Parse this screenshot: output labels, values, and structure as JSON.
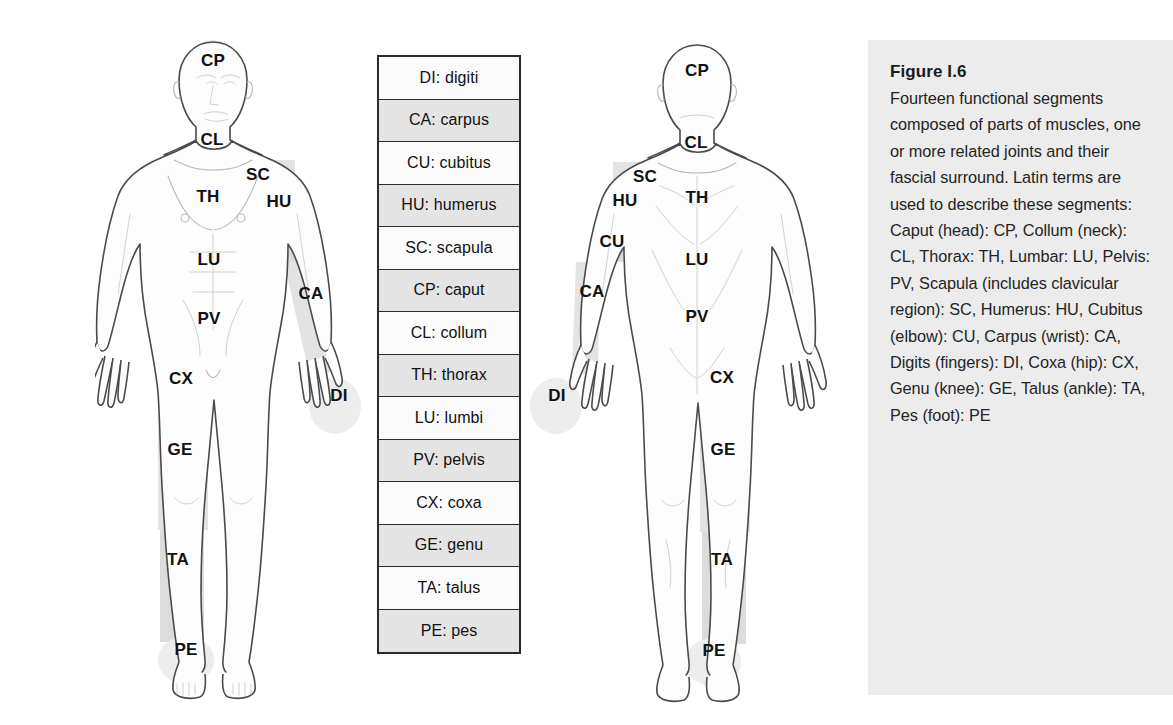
{
  "legend": {
    "name": "segment-abbreviation-key",
    "rows": [
      {
        "code": "DI",
        "term": "digiti",
        "text": "DI: digiti"
      },
      {
        "code": "CA",
        "term": "carpus",
        "text": "CA: carpus"
      },
      {
        "code": "CU",
        "term": "cubitus",
        "text": "CU: cubitus"
      },
      {
        "code": "HU",
        "term": "humerus",
        "text": "HU: humerus"
      },
      {
        "code": "SC",
        "term": "scapula",
        "text": "SC: scapula"
      },
      {
        "code": "CP",
        "term": "caput",
        "text": "CP: caput"
      },
      {
        "code": "CL",
        "term": "collum",
        "text": "CL: collum"
      },
      {
        "code": "TH",
        "term": "thorax",
        "text": "TH: thorax"
      },
      {
        "code": "LU",
        "term": "lumbi",
        "text": "LU: lumbi"
      },
      {
        "code": "PV",
        "term": "pelvis",
        "text": "PV: pelvis"
      },
      {
        "code": "CX",
        "term": "coxa",
        "text": "CX: coxa"
      },
      {
        "code": "GE",
        "term": "genu",
        "text": "GE: genu"
      },
      {
        "code": "TA",
        "term": "talus",
        "text": "TA: talus"
      },
      {
        "code": "PE",
        "term": "pes",
        "text": "PE: pes"
      }
    ]
  },
  "anterior": {
    "view": "anterior",
    "labels": [
      {
        "code": "CP",
        "x": 213,
        "y": 66
      },
      {
        "code": "CL",
        "x": 212,
        "y": 145
      },
      {
        "code": "SC",
        "x": 258,
        "y": 180
      },
      {
        "code": "TH",
        "x": 208,
        "y": 202
      },
      {
        "code": "HU",
        "x": 279,
        "y": 207
      },
      {
        "code": "LU",
        "x": 209,
        "y": 265
      },
      {
        "code": "PV",
        "x": 209,
        "y": 324
      },
      {
        "code": "CA",
        "x": 311,
        "y": 299
      },
      {
        "code": "DI",
        "x": 339,
        "y": 401
      },
      {
        "code": "CX",
        "x": 181,
        "y": 384
      },
      {
        "code": "GE",
        "x": 180,
        "y": 455
      },
      {
        "code": "TA",
        "x": 178,
        "y": 565
      },
      {
        "code": "PE",
        "x": 186,
        "y": 655
      }
    ]
  },
  "posterior": {
    "view": "posterior",
    "labels": [
      {
        "code": "CP",
        "x": 697,
        "y": 76
      },
      {
        "code": "CL",
        "x": 696,
        "y": 148
      },
      {
        "code": "SC",
        "x": 645,
        "y": 182
      },
      {
        "code": "TH",
        "x": 697,
        "y": 203
      },
      {
        "code": "HU",
        "x": 625,
        "y": 206
      },
      {
        "code": "CU",
        "x": 612,
        "y": 247
      },
      {
        "code": "CA",
        "x": 592,
        "y": 297
      },
      {
        "code": "DI",
        "x": 557,
        "y": 401
      },
      {
        "code": "LU",
        "x": 697,
        "y": 265
      },
      {
        "code": "PV",
        "x": 697,
        "y": 322
      },
      {
        "code": "CX",
        "x": 722,
        "y": 383
      },
      {
        "code": "GE",
        "x": 723,
        "y": 455
      },
      {
        "code": "TA",
        "x": 722,
        "y": 565
      },
      {
        "code": "PE",
        "x": 714,
        "y": 656
      }
    ]
  },
  "caption": {
    "title": "Figure I.6",
    "body": "Fourteen functional segments composed of parts of muscles, one or more related joints and their fascial surround. Latin terms are used to describe these segments: Caput (head): CP, Collum (neck): CL, Thorax: TH, Lumbar: LU, Pelvis: PV, Scapula (includes clavicular region): SC, Humerus: HU, Cubitus (elbow): CU, Carpus (wrist): CA, Digits (fingers): DI, Coxa (hip): CX, Genu (knee): GE, Talus (ankle): TA, Pes (foot): PE"
  },
  "colors": {
    "panel_background": "#ececec",
    "segment_shade": "#e3e3e3",
    "table_border": "#2b2b2b",
    "row_tone_light": "#fbfbfb",
    "row_tone_dark": "#e4e4e4",
    "outline": "#4a4a4a"
  }
}
